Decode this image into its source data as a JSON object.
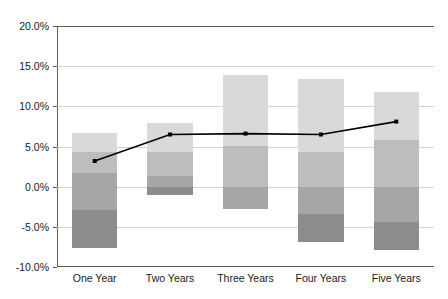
{
  "chart_data": {
    "type": "bar",
    "title": "",
    "subtitle": "",
    "xlabel": "",
    "ylabel": "",
    "categories": [
      "One Year",
      "Two Years",
      "Three Years",
      "Four Years",
      "Five Years"
    ],
    "ylim": [
      -10.0,
      20.0
    ],
    "ytick_labels": [
      "20.0%",
      "15.0%",
      "10.0%",
      "5.0%",
      "0.0%",
      "-5.0%",
      "-10.0%"
    ],
    "ytick_values": [
      20.0,
      15.0,
      10.0,
      5.0,
      0.0,
      -5.0,
      -10.0
    ],
    "grid": true,
    "legend": "none",
    "value_format": "percent",
    "band_boundaries": [
      {
        "category": "One Year",
        "levels": [
          6.7,
          4.3,
          1.7,
          -2.9,
          -7.6
        ]
      },
      {
        "category": "Two Years",
        "levels": [
          7.9,
          4.3,
          1.3,
          0.0,
          -1.1
        ]
      },
      {
        "category": "Three Years",
        "levels": [
          13.9,
          5.1,
          0.0,
          -2.8
        ]
      },
      {
        "category": "Four Years",
        "levels": [
          13.4,
          4.3,
          0.0,
          -3.4,
          -6.9
        ]
      },
      {
        "category": "Five Years",
        "levels": [
          11.8,
          5.8,
          0.0,
          -4.4,
          -7.9
        ]
      }
    ],
    "series": [
      {
        "name": "Band 1 (outer upper)",
        "color": "#d9d9d9",
        "tops": [
          6.7,
          7.9,
          13.9,
          13.4,
          11.8
        ],
        "bottoms": [
          4.3,
          4.3,
          5.1,
          4.3,
          5.8
        ]
      },
      {
        "name": "Band 2 (inner upper)",
        "color": "#bdbdbd",
        "tops": [
          4.3,
          4.3,
          5.1,
          4.3,
          5.8
        ],
        "bottoms": [
          1.7,
          1.3,
          0.0,
          0.0,
          0.0
        ]
      },
      {
        "name": "Band 3 (inner lower)",
        "color": "#a6a6a6",
        "tops": [
          1.7,
          1.3,
          0.0,
          0.0,
          0.0
        ],
        "bottoms": [
          -2.9,
          0.0,
          -2.8,
          -3.4,
          -4.4
        ]
      },
      {
        "name": "Band 4 (outer lower)",
        "color": "#8c8c8c",
        "tops": [
          -2.9,
          0.0,
          -2.8,
          -3.4,
          -4.4
        ],
        "bottoms": [
          -7.6,
          -1.1,
          -2.8,
          -6.9,
          -7.9
        ]
      }
    ],
    "line_series": {
      "name": "Median",
      "color": "#000000",
      "marker": "square",
      "values": [
        3.2,
        6.5,
        6.6,
        6.5,
        8.1
      ]
    }
  }
}
